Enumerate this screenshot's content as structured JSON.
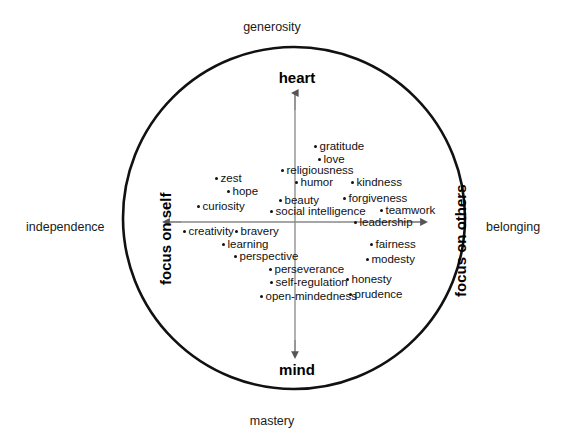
{
  "figure": {
    "title_visible": false,
    "background_color": "#ffffff",
    "stroke_color": "#000000"
  },
  "outer_labels": {
    "top": "generosity",
    "bottom": "mastery",
    "left": "independence",
    "right": "belonging"
  },
  "axis_poles": {
    "top": "heart",
    "bottom": "mind",
    "left": "focus on self",
    "right": "focus on others"
  },
  "chart_data": {
    "type": "scatter",
    "title": "",
    "xlabel": "focus on self ↔ focus on others",
    "ylabel": "heart ↔ mind",
    "grid": false,
    "legend": "none",
    "axis_annotations": {
      "x_negative_outer": "independence",
      "x_positive_outer": "belonging",
      "y_positive_outer": "generosity",
      "y_negative_outer": "mastery",
      "x_negative_inner": "focus on self",
      "x_positive_inner": "focus on others",
      "y_positive_inner": "heart",
      "y_negative_inner": "mind"
    },
    "xlim": [
      -1,
      1
    ],
    "ylim": [
      -1,
      1
    ],
    "points": [
      {
        "label": "gratitude",
        "px": 316,
        "py": 146,
        "side": "right"
      },
      {
        "label": "love",
        "px": 320,
        "py": 159,
        "side": "right"
      },
      {
        "label": "religiousness",
        "px": 283,
        "py": 170,
        "side": "right"
      },
      {
        "label": "humor",
        "px": 297,
        "py": 182,
        "side": "right"
      },
      {
        "label": "kindness",
        "px": 353,
        "py": 182,
        "side": "right"
      },
      {
        "label": "zest",
        "px": 217,
        "py": 178,
        "side": "right"
      },
      {
        "label": "hope",
        "px": 229,
        "py": 191,
        "side": "right"
      },
      {
        "label": "curiosity",
        "px": 199,
        "py": 206,
        "side": "right"
      },
      {
        "label": "beauty",
        "px": 281,
        "py": 200,
        "side": "right"
      },
      {
        "label": "forgiveness",
        "px": 345,
        "py": 198,
        "side": "right"
      },
      {
        "label": "social intelligence",
        "px": 272,
        "py": 211,
        "side": "right"
      },
      {
        "label": "teamwork",
        "px": 382,
        "py": 210,
        "side": "right"
      },
      {
        "label": "leadership",
        "px": 356,
        "py": 222,
        "side": "right"
      },
      {
        "label": "creativity",
        "px": 185,
        "py": 231,
        "side": "right"
      },
      {
        "label": "bravery",
        "px": 237,
        "py": 231,
        "side": "right"
      },
      {
        "label": "learning",
        "px": 224,
        "py": 244,
        "side": "right"
      },
      {
        "label": "perspective",
        "px": 236,
        "py": 256,
        "side": "right"
      },
      {
        "label": "fairness",
        "px": 372,
        "py": 244,
        "side": "right"
      },
      {
        "label": "modesty",
        "px": 368,
        "py": 259,
        "side": "right"
      },
      {
        "label": "perseverance",
        "px": 271,
        "py": 269,
        "side": "right"
      },
      {
        "label": "self-regulation",
        "px": 272,
        "py": 282,
        "side": "right"
      },
      {
        "label": "honesty",
        "px": 348,
        "py": 279,
        "side": "right"
      },
      {
        "label": "open-mindedness",
        "px": 262,
        "py": 296,
        "side": "right"
      },
      {
        "label": "prudence",
        "px": 351,
        "py": 294,
        "side": "right"
      }
    ]
  }
}
